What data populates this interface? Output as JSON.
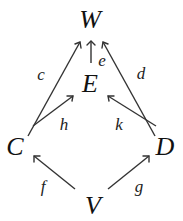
{
  "diagram": {
    "type": "commutative-diagram",
    "nodes": [
      {
        "id": "W",
        "label": "W",
        "x": 90,
        "y": 28
      },
      {
        "id": "E",
        "label": "E",
        "x": 90,
        "y": 92
      },
      {
        "id": "C",
        "label": "C",
        "x": 15,
        "y": 155
      },
      {
        "id": "D",
        "label": "D",
        "x": 163,
        "y": 155
      },
      {
        "id": "V",
        "label": "V",
        "x": 93,
        "y": 214
      }
    ],
    "edges": [
      {
        "from": "C",
        "to": "W",
        "label": "c"
      },
      {
        "from": "E",
        "to": "W",
        "label": "e"
      },
      {
        "from": "D",
        "to": "W",
        "label": "d"
      },
      {
        "from": "C",
        "to": "E",
        "label": "h"
      },
      {
        "from": "D",
        "to": "E",
        "label": "k"
      },
      {
        "from": "V",
        "to": "C",
        "label": "f"
      },
      {
        "from": "V",
        "to": "D",
        "label": "g"
      }
    ]
  }
}
